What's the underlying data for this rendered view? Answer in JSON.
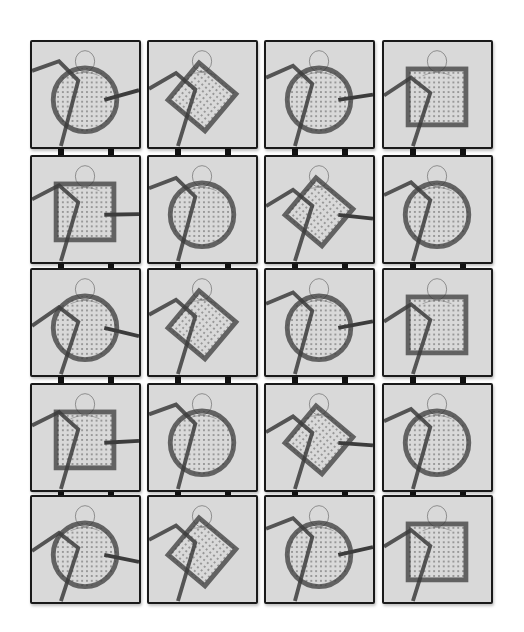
{
  "artwork": {
    "grid": {
      "columns": 4,
      "rows": 5
    },
    "background": "#ffffff",
    "panel_fill": "#d9d9d9",
    "ink": "#1a1a1a",
    "panels": [
      {
        "row": 0,
        "col": 0,
        "shape": "circle",
        "figure": "figure crouching, head down"
      },
      {
        "row": 0,
        "col": 1,
        "shape": "diamond",
        "figure": "seated figure hand to face"
      },
      {
        "row": 0,
        "col": 2,
        "shape": "circle",
        "figure": "figure covering face"
      },
      {
        "row": 0,
        "col": 3,
        "shape": "square",
        "figure": "figure peering over"
      },
      {
        "row": 1,
        "col": 0,
        "shape": "square",
        "figure": "figure behind square"
      },
      {
        "row": 1,
        "col": 1,
        "shape": "circle",
        "figure": "crouching figure"
      },
      {
        "row": 1,
        "col": 2,
        "shape": "diamond",
        "figure": "reclining figure"
      },
      {
        "row": 1,
        "col": 3,
        "shape": "circle",
        "figure": "cross-legged figure"
      },
      {
        "row": 2,
        "col": 0,
        "shape": "circle",
        "figure": "figure from behind"
      },
      {
        "row": 2,
        "col": 1,
        "shape": "diamond",
        "figure": "long-haired figure"
      },
      {
        "row": 2,
        "col": 2,
        "shape": "circle",
        "figure": "figure hand to mouth"
      },
      {
        "row": 2,
        "col": 3,
        "shape": "square",
        "figure": "figure with glasses"
      },
      {
        "row": 3,
        "col": 0,
        "shape": "square",
        "figure": "figure bending forward"
      },
      {
        "row": 3,
        "col": 1,
        "shape": "circle",
        "figure": "figure hands on head"
      },
      {
        "row": 3,
        "col": 2,
        "shape": "diamond",
        "figure": "figure leaning"
      },
      {
        "row": 3,
        "col": 3,
        "shape": "circle",
        "figure": "figure hand on head"
      },
      {
        "row": 4,
        "col": 0,
        "shape": "circle",
        "figure": "figure head in arms"
      },
      {
        "row": 4,
        "col": 1,
        "shape": "diamond",
        "figure": "figure seated hugging knees"
      },
      {
        "row": 4,
        "col": 2,
        "shape": "circle",
        "figure": "two figures"
      },
      {
        "row": 4,
        "col": 3,
        "shape": "square",
        "figure": "figure hand over face"
      }
    ],
    "signature": "signature (illegible)"
  }
}
